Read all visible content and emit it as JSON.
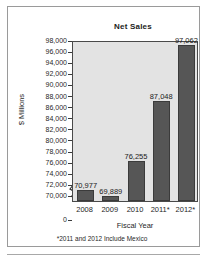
{
  "panel": {
    "footnote": "*2011 and 2012 Include Mexico"
  },
  "chart_data": {
    "type": "bar",
    "title": "Net Sales",
    "xlabel": "Fiscal Year",
    "ylabel": "$ Millions",
    "categories": [
      "2008",
      "2009",
      "2010",
      "2011*",
      "2012*"
    ],
    "values": [
      70977,
      69889,
      76255,
      87048,
      97062
    ],
    "value_labels": [
      "70,977",
      "69,889",
      "76,255",
      "87,048",
      "97,062"
    ],
    "ylim": [
      69000,
      98000
    ],
    "yticks": [
      98000,
      96000,
      94000,
      92000,
      90000,
      88000,
      86000,
      84000,
      82000,
      80000,
      78000,
      76000,
      74000,
      72000,
      70000,
      0
    ],
    "ytick_labels": [
      "98,000",
      "96,000",
      "94,000",
      "92,000",
      "90,000",
      "88,000",
      "86,000",
      "84,000",
      "82,000",
      "80,000",
      "78,000",
      "76,000",
      "74,000",
      "72,000",
      "70,000",
      "0"
    ],
    "axis_break": true,
    "grid": false,
    "legend": "none",
    "bar_color": "#565656",
    "plot_background": "#e3e3e3"
  }
}
